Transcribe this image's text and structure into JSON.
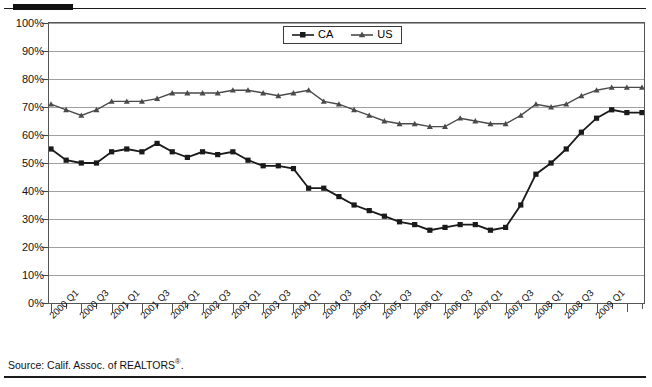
{
  "source": {
    "prefix": "Source: Calif. Assoc. of REALTORS",
    "mark": "®",
    "suffix": "."
  },
  "chart_data": {
    "type": "line",
    "title": "",
    "xlabel": "",
    "ylabel": "",
    "ylim": [
      0,
      100
    ],
    "ytick_labels": [
      "0%",
      "10%",
      "20%",
      "30%",
      "40%",
      "50%",
      "60%",
      "70%",
      "80%",
      "90%",
      "100%"
    ],
    "ytick_values": [
      0,
      10,
      20,
      30,
      40,
      50,
      60,
      70,
      80,
      90,
      100
    ],
    "grid": true,
    "legend_position": "top-center",
    "x": [
      "2000 Q1",
      "2000 Q2",
      "2000 Q3",
      "2000 Q4",
      "2001 Q1",
      "2001 Q2",
      "2001 Q3",
      "2001 Q4",
      "2002 Q1",
      "2002 Q2",
      "2002 Q3",
      "2002 Q4",
      "2003 Q1",
      "2003 Q2",
      "2003 Q3",
      "2003 Q4",
      "2004 Q1",
      "2004 Q2",
      "2004 Q3",
      "2004 Q4",
      "2005 Q1",
      "2005 Q2",
      "2005 Q3",
      "2005 Q4",
      "2006 Q1",
      "2006 Q2",
      "2006 Q3",
      "2006 Q4",
      "2007 Q1",
      "2007 Q2",
      "2007 Q3",
      "2007 Q4",
      "2008 Q1",
      "2008 Q2",
      "2008 Q3",
      "2008 Q4",
      "2009 Q1",
      "2009 Q2",
      "2009 Q3",
      "2009 Q4"
    ],
    "xtick_labels": [
      "2000 Q1",
      "2000 Q3",
      "2001 Q1",
      "2001 Q3",
      "2002 Q1",
      "2002 Q3",
      "2003 Q1",
      "2003 Q3",
      "2004 Q1",
      "2004 Q3",
      "2005 Q1",
      "2005 Q3",
      "2006 Q1",
      "2006 Q3",
      "2007 Q1",
      "2007 Q3",
      "2008 Q1",
      "2008 Q3",
      "2009 Q1"
    ],
    "series": [
      {
        "name": "CA",
        "color": "#1a1a1a",
        "marker": "square",
        "values": [
          55,
          51,
          50,
          50,
          54,
          55,
          54,
          57,
          54,
          52,
          54,
          53,
          54,
          51,
          49,
          49,
          48,
          41,
          41,
          38,
          35,
          33,
          31,
          29,
          28,
          26,
          27,
          28,
          28,
          26,
          27,
          35,
          46,
          50,
          55,
          61,
          66,
          69,
          68,
          68
        ]
      },
      {
        "name": "US",
        "color": "#4a4a4a",
        "marker": "triangle",
        "values": [
          71,
          69,
          67,
          69,
          72,
          72,
          72,
          73,
          75,
          75,
          75,
          75,
          76,
          76,
          75,
          74,
          75,
          76,
          72,
          71,
          69,
          67,
          65,
          64,
          64,
          63,
          63,
          66,
          65,
          64,
          64,
          67,
          71,
          70,
          71,
          74,
          76,
          77,
          77,
          77
        ]
      }
    ]
  }
}
